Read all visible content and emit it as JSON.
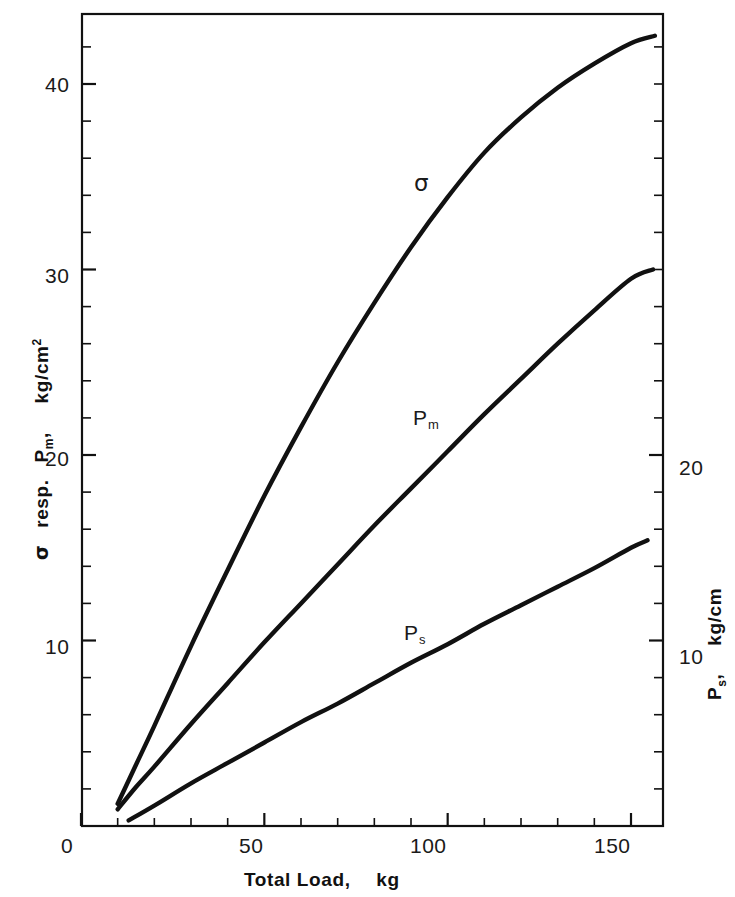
{
  "figure": {
    "background_color": "#ffffff",
    "line_color": "#111111",
    "frame_color": "#111111"
  },
  "axes": {
    "x": {
      "title_main": "Total Load,",
      "title_unit": "kg",
      "tick_labels": [
        "0",
        "50",
        "100",
        "150"
      ],
      "tick_values": [
        0,
        50,
        100,
        150
      ],
      "minor_tick_step": 10,
      "range": [
        0,
        158.7
      ]
    },
    "y_left": {
      "title_symbol": "σ",
      "title_text": "resp.",
      "title_series": "P",
      "title_series_sub": "m",
      "title_comma": ",",
      "title_unit": "kg/cm",
      "title_unit_sup": "2",
      "tick_labels": [
        "10",
        "20",
        "30",
        "40"
      ],
      "tick_values": [
        10,
        20,
        30,
        40
      ],
      "minor_tick_step": 2,
      "range": [
        0,
        43.8
      ]
    },
    "y_right": {
      "title_series": "P",
      "title_series_sub": "s",
      "title_comma": ",",
      "title_unit": "kg/cm",
      "tick_labels": [
        "10",
        "20"
      ],
      "tick_values": [
        10,
        20
      ],
      "minor_tick_step": 2,
      "range": [
        0,
        43.8
      ]
    }
  },
  "curve_labels": [
    {
      "name": "sigma",
      "text": "σ",
      "sub": "",
      "x": 421,
      "y": 183
    },
    {
      "name": "p-m",
      "text": "P",
      "sub": "m",
      "x": 420,
      "y": 420
    },
    {
      "name": "p-s",
      "text": "P",
      "sub": "s",
      "x": 410,
      "y": 634
    }
  ],
  "chart_data": {
    "type": "line",
    "title": "",
    "xlabel": "Total Load,   kg",
    "ylabel": "σ resp. P_m,   kg/cm²",
    "ylabel_right": "P_s,   kg/cm",
    "xlim": [
      0,
      158.7
    ],
    "ylim": [
      0,
      43.8
    ],
    "ylim_right": [
      0,
      43.8
    ],
    "xticks": [
      0,
      50,
      100,
      150
    ],
    "yticks": [
      10,
      20,
      30,
      40
    ],
    "yticks_right": [
      10,
      20
    ],
    "grid": false,
    "legend": "inline-curve-labels",
    "series": [
      {
        "name": "σ",
        "axis": "left",
        "unit": "kg/cm^2",
        "x": [
          10,
          15,
          20,
          30,
          40,
          50,
          60,
          70,
          80,
          90,
          100,
          110,
          120,
          130,
          140,
          150,
          156.5
        ],
        "y": [
          1.2,
          3.3,
          5.4,
          9.7,
          13.8,
          17.8,
          21.5,
          25.0,
          28.2,
          31.2,
          33.9,
          36.3,
          38.2,
          39.8,
          41.1,
          42.2,
          42.6
        ]
      },
      {
        "name": "P_m",
        "axis": "left",
        "unit": "kg/cm^2",
        "x": [
          10,
          15,
          20,
          30,
          40,
          50,
          60,
          70,
          80,
          90,
          100,
          110,
          120,
          130,
          140,
          150,
          156
        ],
        "y": [
          0.9,
          2.1,
          3.2,
          5.5,
          7.7,
          9.9,
          12.0,
          14.1,
          16.2,
          18.2,
          20.2,
          22.2,
          24.1,
          26.0,
          27.8,
          29.5,
          30.0
        ]
      },
      {
        "name": "P_s",
        "axis": "right",
        "unit": "kg/cm",
        "x": [
          13,
          20,
          30,
          40,
          50,
          60,
          70,
          80,
          90,
          100,
          110,
          120,
          130,
          140,
          150,
          154.5
        ],
        "y": [
          0.3,
          1.1,
          2.3,
          3.4,
          4.5,
          5.6,
          6.6,
          7.7,
          8.8,
          9.8,
          10.9,
          11.9,
          12.9,
          13.9,
          15.0,
          15.4
        ]
      }
    ]
  },
  "geometry": {
    "frame": {
      "left": 82,
      "right": 663,
      "top": 14,
      "bottom": 826
    },
    "x_px_per_unit": 3.6667,
    "y_px_per_unit": 18.55
  }
}
